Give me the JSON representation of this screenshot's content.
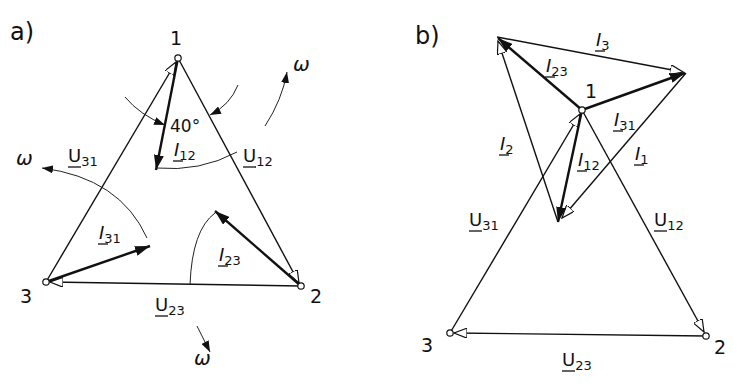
{
  "panels": [
    {
      "id": "a",
      "label": "a)",
      "nodes": [
        {
          "name": "1",
          "x": 178,
          "y": 58
        },
        {
          "name": "2",
          "x": 301,
          "y": 286
        },
        {
          "name": "3",
          "x": 46,
          "y": 282
        }
      ],
      "voltages": [
        {
          "label": "U",
          "sub": "31",
          "from": "3",
          "to": "1"
        },
        {
          "label": "U",
          "sub": "12",
          "from": "1",
          "to": "2"
        },
        {
          "label": "U",
          "sub": "23",
          "from": "2",
          "to": "3"
        }
      ],
      "currents": [
        {
          "label": "I",
          "sub": "12"
        },
        {
          "label": "I",
          "sub": "31"
        },
        {
          "label": "I",
          "sub": "23"
        }
      ],
      "angle": "40°",
      "rotation_symbol": "ω"
    },
    {
      "id": "b",
      "label": "b)",
      "nodes": [
        {
          "name": "1",
          "x": 582,
          "y": 110
        },
        {
          "name": "2",
          "x": 706,
          "y": 336
        },
        {
          "name": "3",
          "x": 450,
          "y": 333
        }
      ],
      "voltages": [
        {
          "label": "U",
          "sub": "31"
        },
        {
          "label": "U",
          "sub": "12"
        },
        {
          "label": "U",
          "sub": "23"
        }
      ],
      "currents": [
        {
          "label": "I",
          "sub": "3"
        },
        {
          "label": "I",
          "sub": "23"
        },
        {
          "label": "I",
          "sub": "31"
        },
        {
          "label": "I",
          "sub": "2"
        },
        {
          "label": "I",
          "sub": "12"
        },
        {
          "label": "I",
          "sub": "1"
        }
      ]
    }
  ],
  "a": {
    "title": "a)",
    "n1": "1",
    "n2": "2",
    "n3": "3",
    "u31": "U",
    "u31s": "31",
    "u12": "U",
    "u12s": "12",
    "u23": "U",
    "u23s": "23",
    "i12": "I",
    "i12s": "12",
    "i31": "I",
    "i31s": "31",
    "i23": "I",
    "i23s": "23",
    "angle": "40°",
    "omega": "ω"
  },
  "b": {
    "title": "b)",
    "n1": "1",
    "n2": "2",
    "n3": "3",
    "i3": "I",
    "i3s": "3",
    "i23": "I",
    "i23s": "23",
    "i31": "I",
    "i31s": "31",
    "i2": "I",
    "i2s": "2",
    "i12": "I",
    "i12s": "12",
    "i1": "I",
    "i1s": "1",
    "u31": "U",
    "u31s": "31",
    "u12": "U",
    "u12s": "12",
    "u23": "U",
    "u23s": "23"
  }
}
